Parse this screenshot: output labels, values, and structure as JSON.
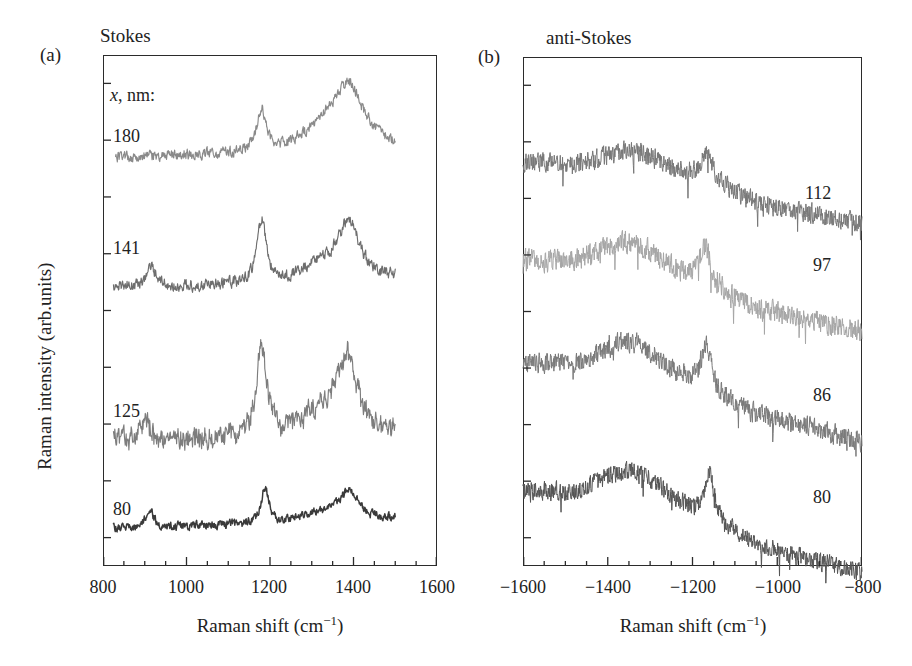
{
  "figure": {
    "panels": [
      {
        "letter": "(a)",
        "heading": "Stokes",
        "series_header": "x, nm:",
        "xlabel_text": "Raman shift (cm",
        "xlabel_exp": "−1",
        "xlabel_tail": ")",
        "ylabel": "Raman intensity (arb.units)",
        "xticks": [
          "800",
          "1000",
          "1200",
          "1400",
          "1600"
        ],
        "curve_labels": [
          "180",
          "141",
          "125",
          "80"
        ]
      },
      {
        "letter": "(b)",
        "heading": "anti-Stokes",
        "xlabel_text": "Raman shift (cm",
        "xlabel_exp": "−1",
        "xlabel_tail": ")",
        "xticks": [
          "−1600",
          "−1400",
          "−1200",
          "−1000",
          "−800"
        ],
        "curve_labels": [
          "112",
          "97",
          "86",
          "80"
        ]
      }
    ]
  },
  "chart_data": [
    {
      "type": "line",
      "panel": "(a)",
      "title": "Stokes",
      "xlabel": "Raman shift (cm-1)",
      "ylabel": "Raman intensity (arb.units)",
      "xlim": [
        800,
        1600
      ],
      "ylim": [
        0,
        1
      ],
      "xticks": [
        800,
        1000,
        1200,
        1400,
        1600
      ],
      "xminor_step": 50,
      "yticks_unlabeled": 9,
      "grid": false,
      "legend": "inline-right-of-curve",
      "series_variable": "x, nm:",
      "series": [
        {
          "name": "180",
          "color": "#8a8a8a",
          "baseline": 0.8,
          "x_start": 830,
          "x_end": 1500,
          "peaks": [
            {
              "center": 1180,
              "height": 0.085,
              "width": 14
            },
            {
              "center": 1390,
              "height": 0.115,
              "width": 45
            }
          ],
          "noise": 0.009
        },
        {
          "name": "141",
          "color": "#6e6e6e",
          "baseline": 0.545,
          "x_start": 825,
          "x_end": 1500,
          "peaks": [
            {
              "center": 915,
              "height": 0.045,
              "width": 12
            },
            {
              "center": 1180,
              "height": 0.125,
              "width": 13
            },
            {
              "center": 1390,
              "height": 0.105,
              "width": 30
            }
          ],
          "noise": 0.01
        },
        {
          "name": "125",
          "color": "#7d7d7d",
          "baseline": 0.245,
          "x_start": 825,
          "x_end": 1500,
          "peaks": [
            {
              "center": 900,
              "height": 0.05,
              "width": 10
            },
            {
              "center": 1180,
              "height": 0.175,
              "width": 14
            },
            {
              "center": 1385,
              "height": 0.14,
              "width": 28
            }
          ],
          "noise": 0.016
        },
        {
          "name": "80",
          "color": "#3a3a3a",
          "baseline": 0.075,
          "x_start": 825,
          "x_end": 1500,
          "peaks": [
            {
              "center": 912,
              "height": 0.034,
              "width": 11
            },
            {
              "center": 1188,
              "height": 0.072,
              "width": 11
            },
            {
              "center": 1390,
              "height": 0.053,
              "width": 26
            }
          ],
          "noise": 0.007
        }
      ]
    },
    {
      "type": "line",
      "panel": "(b)",
      "title": "anti-Stokes",
      "xlabel": "Raman shift (cm-1)",
      "ylabel": "Raman intensity (arb.units)",
      "xlim": [
        -1600,
        -800
      ],
      "ylim": [
        0,
        1
      ],
      "xticks": [
        -1600,
        -1400,
        -1200,
        -1000,
        -800
      ],
      "xminor_step": 50,
      "yticks_unlabeled": 9,
      "grid": false,
      "legend": "inline-right-of-curve",
      "series": [
        {
          "name": "112",
          "color": "#787878",
          "baseline": 0.795,
          "slope_drop": 0.085,
          "x_start": -1600,
          "x_end": -800,
          "broad_band": {
            "center": -1340,
            "height": 0.035,
            "width": 90
          },
          "peaks": [
            {
              "center": -1165,
              "height": 0.05,
              "width": 16
            }
          ],
          "noise": 0.018
        },
        {
          "name": "97",
          "color": "#a6a6a6",
          "baseline": 0.6,
          "slope_drop": 0.105,
          "x_start": -1600,
          "x_end": -800,
          "broad_band": {
            "center": -1350,
            "height": 0.055,
            "width": 95
          },
          "peaks": [
            {
              "center": -1170,
              "height": 0.07,
              "width": 15
            }
          ],
          "noise": 0.02
        },
        {
          "name": "86",
          "color": "#7a7a7a",
          "baseline": 0.4,
          "slope_drop": 0.12,
          "x_start": -1600,
          "x_end": -800,
          "broad_band": {
            "center": -1345,
            "height": 0.06,
            "width": 95
          },
          "peaks": [
            {
              "center": -1168,
              "height": 0.085,
              "width": 13
            }
          ],
          "noise": 0.019
        },
        {
          "name": "80",
          "color": "#555555",
          "baseline": 0.15,
          "slope_drop": 0.13,
          "x_start": -1600,
          "x_end": -800,
          "broad_band": {
            "center": -1340,
            "height": 0.06,
            "width": 95
          },
          "peaks": [
            {
              "center": -1160,
              "height": 0.09,
              "width": 12
            }
          ],
          "noise": 0.017
        }
      ]
    }
  ]
}
